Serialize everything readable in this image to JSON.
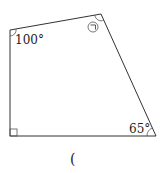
{
  "figure": {
    "shape": "quadrilateral",
    "vertices": {
      "top_left": [
        10,
        30
      ],
      "top_right": [
        101,
        14
      ],
      "bottom_right": [
        156,
        136
      ],
      "bottom_left": [
        10,
        136
      ]
    },
    "angles": {
      "top_left": "100°",
      "top_right": "㉠",
      "bottom_right": "65°",
      "bottom_left": "right-angle"
    },
    "answer_blank": "("
  }
}
